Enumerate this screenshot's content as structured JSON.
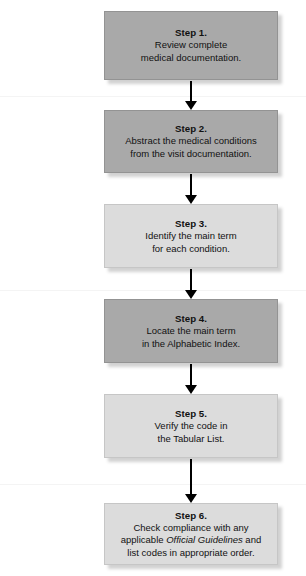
{
  "diagram": {
    "type": "vertical-flowchart",
    "orientation": "top-to-bottom",
    "step_count": 6,
    "colors": {
      "box_dark": "#a9a9a9",
      "box_light": "#dcdcdc",
      "border": "#9a9a9a",
      "text": "#111111",
      "arrow": "#000000",
      "background": "#ffffff"
    },
    "steps": [
      {
        "id": "step-1",
        "title": "Step 1.",
        "shade": "dark",
        "lines": [
          "Review complete",
          "medical documentation."
        ]
      },
      {
        "id": "step-2",
        "title": "Step 2.",
        "shade": "dark",
        "lines": [
          "Abstract the medical conditions",
          "from the visit documentation."
        ]
      },
      {
        "id": "step-3",
        "title": "Step 3.",
        "shade": "light",
        "lines": [
          "Identify the main term",
          "for each condition."
        ]
      },
      {
        "id": "step-4",
        "title": "Step 4.",
        "shade": "dark",
        "lines": [
          "Locate the main term",
          "in the Alphabetic Index."
        ]
      },
      {
        "id": "step-5",
        "title": "Step 5.",
        "shade": "light",
        "lines": [
          "Verify the code in",
          "the Tabular List."
        ]
      },
      {
        "id": "step-6",
        "title": "Step 6.",
        "shade": "light",
        "lines": [
          "Check compliance with any",
          "applicable Official Guidelines and",
          "list codes in appropriate order."
        ],
        "line_2_prefix": "applicable ",
        "line_2_italic": "Official Guidelines",
        "line_2_suffix": " and"
      }
    ],
    "connectors": [
      {
        "id": "arrow-1",
        "from": "step-1",
        "to": "step-2",
        "glyph": "down-arrow"
      },
      {
        "id": "arrow-2",
        "from": "step-2",
        "to": "step-3",
        "glyph": "down-arrow"
      },
      {
        "id": "arrow-3",
        "from": "step-3",
        "to": "step-4",
        "glyph": "down-arrow"
      },
      {
        "id": "arrow-4",
        "from": "step-4",
        "to": "step-5",
        "glyph": "down-arrow"
      },
      {
        "id": "arrow-5",
        "from": "step-5",
        "to": "step-6",
        "glyph": "down-arrow"
      }
    ]
  }
}
